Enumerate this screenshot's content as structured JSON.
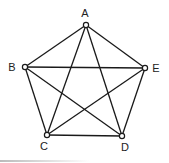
{
  "diagram": {
    "type": "complete-graph",
    "nodes": [
      {
        "id": "A",
        "label": "A",
        "x": 86,
        "y": 25,
        "lx": 85,
        "ly": 17
      },
      {
        "id": "B",
        "label": "B",
        "x": 25,
        "y": 67,
        "lx": 12,
        "ly": 71
      },
      {
        "id": "E",
        "label": "E",
        "x": 145,
        "y": 68,
        "lx": 156,
        "ly": 72
      },
      {
        "id": "C",
        "label": "C",
        "x": 47,
        "y": 135,
        "lx": 44,
        "ly": 150
      },
      {
        "id": "D",
        "label": "D",
        "x": 122,
        "y": 136,
        "lx": 125,
        "ly": 151
      }
    ],
    "edges": [
      [
        "A",
        "B"
      ],
      [
        "A",
        "E"
      ],
      [
        "A",
        "C"
      ],
      [
        "A",
        "D"
      ],
      [
        "B",
        "E"
      ],
      [
        "B",
        "C"
      ],
      [
        "B",
        "D"
      ],
      [
        "C",
        "D"
      ],
      [
        "C",
        "E"
      ],
      [
        "D",
        "E"
      ]
    ]
  },
  "colors": {
    "stroke": "#1a1a1a",
    "node_fill": "#ffffff",
    "label": "#222222"
  }
}
